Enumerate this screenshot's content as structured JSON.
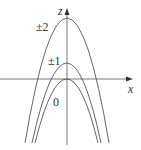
{
  "diagram": {
    "axes": {
      "horizontal_label": "x",
      "vertical_label": "z"
    },
    "curves": [
      {
        "label": "±2",
        "vertex_y": 18
      },
      {
        "label": "±1",
        "vertex_y": 63
      },
      {
        "label": "0",
        "vertex_y": 79
      }
    ]
  }
}
